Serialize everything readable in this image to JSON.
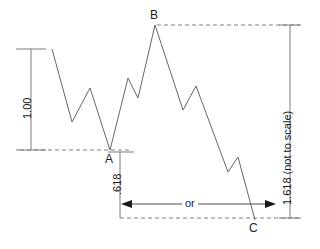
{
  "chart_data": {
    "type": "line",
    "title": "",
    "subtitle": "",
    "xlabel": "",
    "ylabel": "",
    "grid": false,
    "legend": null,
    "axis_ranges": {
      "x": [
        0,
        320
      ],
      "y": [
        0,
        249
      ]
    },
    "series": [
      {
        "name": "price-zigzag",
        "points": [
          [
            52,
            49
          ],
          [
            72,
            122
          ],
          [
            90,
            88
          ],
          [
            110,
            150
          ],
          [
            128,
            78
          ],
          [
            138,
            98
          ],
          [
            155,
            25
          ],
          [
            183,
            110
          ],
          [
            196,
            86
          ],
          [
            228,
            172
          ],
          [
            238,
            157
          ],
          [
            255,
            220
          ]
        ]
      }
    ],
    "annotations": [
      {
        "name": "point-a",
        "label": "A",
        "x": 110,
        "y": 150,
        "meaning": "swing low / start of measured move"
      },
      {
        "name": "point-b",
        "label": "B",
        "x": 155,
        "y": 25,
        "meaning": "swing high"
      },
      {
        "name": "point-c",
        "label": "C",
        "x": 253,
        "y": 218,
        "meaning": "projected target low"
      }
    ],
    "measures": [
      {
        "name": "measure-one",
        "label": "1.00",
        "orientation": "vertical",
        "from_y": 49,
        "to_y": 150,
        "at_x": 31,
        "value": 1.0
      },
      {
        "name": "measure-618",
        "label": ".618",
        "orientation": "vertical",
        "from_y": 152,
        "to_y": 218,
        "at_x": 120,
        "value": 0.618
      },
      {
        "name": "measure-1618",
        "label": "1.618 (not to scale)",
        "orientation": "vertical",
        "from_y": 25,
        "to_y": 218,
        "at_x": 290,
        "value": 1.618
      }
    ],
    "connectors": [
      {
        "name": "or-arrow",
        "label": "or",
        "orientation": "horizontal",
        "from_x": 122,
        "to_x": 275,
        "at_y": 204,
        "arrowheads": "both"
      }
    ],
    "guides": [
      {
        "name": "guide-a",
        "style": "dashed",
        "y": 150,
        "from_x": 20,
        "to_x": 130
      },
      {
        "name": "guide-b",
        "style": "dashed",
        "y": 25,
        "from_x": 157,
        "to_x": 300
      },
      {
        "name": "guide-c",
        "style": "dashed",
        "y": 218,
        "from_x": 120,
        "to_x": 300
      }
    ]
  },
  "labels": {
    "point_a": "A",
    "point_b": "B",
    "point_c": "C",
    "measure_one": "1.00",
    "measure_618": ".618",
    "measure_1618": "1.618 (not to scale)",
    "connector_or": "or"
  },
  "colors": {
    "line": "#666666",
    "guide": "#808080",
    "measure": "#7a7a7a",
    "text": "#1a1a1a",
    "background": "#ffffff"
  }
}
